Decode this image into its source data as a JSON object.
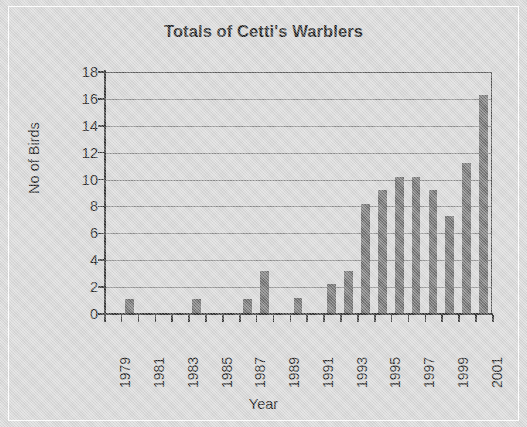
{
  "figure": {
    "background_color": "#d6d6d6",
    "bar_color": "#6e6e6e",
    "axis_color": "#2e2e2e",
    "grid_color": "#7d7d7d"
  },
  "chart_data": {
    "type": "bar",
    "title": "Totals of Cetti's Warblers",
    "xlabel": "Year",
    "ylabel": "No of Birds",
    "ylim": [
      0,
      18
    ],
    "ytick_step": 2,
    "yticks": [
      0,
      2,
      4,
      6,
      8,
      10,
      12,
      14,
      16,
      18
    ],
    "ytick_labels": [
      "0",
      "2",
      "4",
      "6",
      "8",
      "10",
      "12",
      "14",
      "16",
      "18"
    ],
    "grid": "horizontal",
    "legend": "none",
    "categories": [
      "1979",
      "1980",
      "1981",
      "1982",
      "1983",
      "1984",
      "1985",
      "1986",
      "1987",
      "1988",
      "1989",
      "1990",
      "1991",
      "1992",
      "1993",
      "1994",
      "1995",
      "1996",
      "1997",
      "1998",
      "1999",
      "2000",
      "2001"
    ],
    "xtick_labels": [
      "1979",
      "",
      "1981",
      "",
      "1983",
      "",
      "1985",
      "",
      "1987",
      "",
      "1989",
      "",
      "1991",
      "",
      "1993",
      "",
      "1995",
      "",
      "1997",
      "",
      "1999",
      "",
      "2001"
    ],
    "values": [
      0,
      1.1,
      0,
      0,
      0,
      1.1,
      0,
      0,
      1.1,
      3.2,
      0,
      1.2,
      0,
      2.2,
      3.2,
      8.2,
      9.2,
      10.2,
      10.2,
      9.2,
      7.3,
      11.2,
      16.3
    ]
  }
}
